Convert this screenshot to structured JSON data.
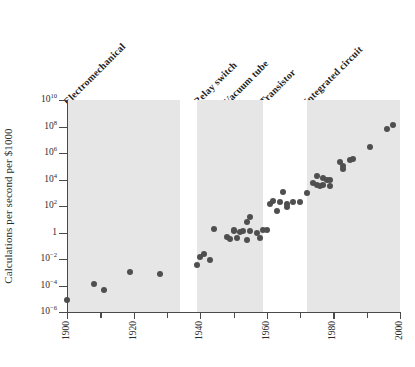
{
  "chart_data": {
    "type": "scatter",
    "title": "",
    "xlabel": "",
    "ylabel": "Calculations per second per $1000",
    "xlim": [
      1900,
      2000
    ],
    "ylim": [
      1e-06,
      10000000000.0
    ],
    "yscale": "log",
    "grid": false,
    "legend": "none",
    "x_ticks": [
      {
        "value": 1900,
        "label": "1900",
        "major": true
      },
      {
        "value": 1910,
        "label": "",
        "major": false
      },
      {
        "value": 1920,
        "label": "1920",
        "major": true
      },
      {
        "value": 1930,
        "label": "",
        "major": false
      },
      {
        "value": 1940,
        "label": "1940",
        "major": true
      },
      {
        "value": 1950,
        "label": "",
        "major": false
      },
      {
        "value": 1960,
        "label": "1960",
        "major": true
      },
      {
        "value": 1970,
        "label": "",
        "major": false
      },
      {
        "value": 1980,
        "label": "1980",
        "major": true
      },
      {
        "value": 1990,
        "label": "",
        "major": false
      },
      {
        "value": 2000,
        "label": "2000",
        "major": true
      }
    ],
    "y_ticks": [
      {
        "value": 10000000000.0,
        "mantissa": "10",
        "exponent": "10"
      },
      {
        "value": 100000000.0,
        "mantissa": "10",
        "exponent": "8"
      },
      {
        "value": 1000000.0,
        "mantissa": "10",
        "exponent": "6"
      },
      {
        "value": 10000.0,
        "mantissa": "10",
        "exponent": "4"
      },
      {
        "value": 100.0,
        "mantissa": "10",
        "exponent": "2"
      },
      {
        "value": 1,
        "mantissa": "1",
        "exponent": ""
      },
      {
        "value": 0.01,
        "mantissa": "10",
        "exponent": "−2"
      },
      {
        "value": 0.0001,
        "mantissa": "10",
        "exponent": "−4"
      },
      {
        "value": 1e-06,
        "mantissa": "10",
        "exponent": "−6"
      }
    ],
    "eras": [
      {
        "name": "Electromechanical",
        "x_start": 1900,
        "x_end": 1934,
        "shaded": true
      },
      {
        "name": "Relay switch",
        "x_start": 1939,
        "x_end": 1948,
        "shaded": true
      },
      {
        "name": "Vacuum tube",
        "x_start": 1948,
        "x_end": 1959,
        "shaded": true
      },
      {
        "name": "Transistor",
        "x_start": 1959,
        "x_end": 1972,
        "shaded": false
      },
      {
        "name": "Integrated circuit",
        "x_start": 1972,
        "x_end": 2000,
        "shaded": true
      }
    ],
    "shaded_bands": [
      {
        "x_start": 1900,
        "x_end": 1934
      },
      {
        "x_start": 1939,
        "x_end": 1959
      },
      {
        "x_start": 1972,
        "x_end": 2000
      }
    ],
    "points": [
      {
        "x": 1900,
        "y": 8e-06
      },
      {
        "x": 1908,
        "y": 0.00013
      },
      {
        "x": 1911,
        "y": 4.5e-05
      },
      {
        "x": 1919,
        "y": 0.0011
      },
      {
        "x": 1928,
        "y": 0.0007
      },
      {
        "x": 1939,
        "y": 0.0038
      },
      {
        "x": 1940,
        "y": 0.015
      },
      {
        "x": 1941,
        "y": 0.022
      },
      {
        "x": 1943,
        "y": 0.008
      },
      {
        "x": 1944,
        "y": 2.0
      },
      {
        "x": 1948,
        "y": 0.45
      },
      {
        "x": 1949,
        "y": 0.35
      },
      {
        "x": 1950,
        "y": 1.2
      },
      {
        "x": 1950,
        "y": 1.5
      },
      {
        "x": 1951,
        "y": 0.4
      },
      {
        "x": 1952,
        "y": 1.1
      },
      {
        "x": 1953,
        "y": 1.3
      },
      {
        "x": 1954,
        "y": 0.25
      },
      {
        "x": 1954,
        "y": 6.0
      },
      {
        "x": 1955,
        "y": 1.4
      },
      {
        "x": 1955,
        "y": 15.0
      },
      {
        "x": 1957,
        "y": 1.0
      },
      {
        "x": 1958,
        "y": 0.4
      },
      {
        "x": 1959,
        "y": 1.6
      },
      {
        "x": 1960,
        "y": 1.5
      },
      {
        "x": 1961,
        "y": 130.0
      },
      {
        "x": 1962,
        "y": 250.0
      },
      {
        "x": 1963,
        "y": 40.0
      },
      {
        "x": 1964,
        "y": 200.0
      },
      {
        "x": 1965,
        "y": 1200.0
      },
      {
        "x": 1966,
        "y": 150.0
      },
      {
        "x": 1966,
        "y": 80.0
      },
      {
        "x": 1968,
        "y": 200.0
      },
      {
        "x": 1970,
        "y": 200.0
      },
      {
        "x": 1972,
        "y": 1000.0
      },
      {
        "x": 1974,
        "y": 5000.0
      },
      {
        "x": 1975,
        "y": 4000.0
      },
      {
        "x": 1975,
        "y": 18000.0
      },
      {
        "x": 1976,
        "y": 3000.0
      },
      {
        "x": 1977,
        "y": 12000.0
      },
      {
        "x": 1977,
        "y": 4000.0
      },
      {
        "x": 1978,
        "y": 9000.0
      },
      {
        "x": 1979,
        "y": 3500.0
      },
      {
        "x": 1979,
        "y": 10000.0
      },
      {
        "x": 1982,
        "y": 200000.0
      },
      {
        "x": 1983,
        "y": 100000.0
      },
      {
        "x": 1983,
        "y": 60000.0
      },
      {
        "x": 1985,
        "y": 300000.0
      },
      {
        "x": 1986,
        "y": 350000.0
      },
      {
        "x": 1991,
        "y": 3000000.0
      },
      {
        "x": 1996,
        "y": 60000000.0
      },
      {
        "x": 1998,
        "y": 120000000.0
      }
    ]
  }
}
